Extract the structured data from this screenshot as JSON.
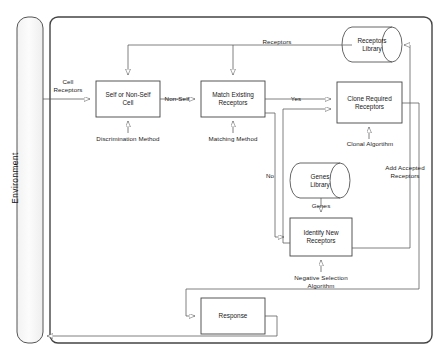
{
  "diagram": {
    "environment_label": "Environment",
    "colors": {
      "stroke": "#555555",
      "box_stroke": "#444444",
      "fill": "#ffffff",
      "env_fill": "#fbfbfb",
      "text": "#1a1a1a"
    },
    "boxes": [
      {
        "id": "self-or-nonself-cell",
        "label": "Self or Non-Self\nCell",
        "line1": "Self or Non-Self",
        "line2": "Cell"
      },
      {
        "id": "match-existing-receptors",
        "label": "Match Existing\nReceptors",
        "line1": "Match Existing",
        "line2": "Receptors"
      },
      {
        "id": "clone-required-receptors",
        "label": "Clone Required\nReceptors",
        "line1": "Clone Required",
        "line2": "Receptors"
      },
      {
        "id": "identify-new-receptors",
        "label": "Identify New\nReceptors",
        "line1": "Identify New",
        "line2": "Receptors"
      },
      {
        "id": "response",
        "label": "Response",
        "line1": "Response",
        "line2": ""
      }
    ],
    "cylinders": [
      {
        "id": "receptors-library",
        "line1": "Receptors",
        "line2": "Library"
      },
      {
        "id": "genes-library",
        "line1": "Genes",
        "line2": "Library"
      }
    ],
    "edge_labels": [
      {
        "id": "cell-receptors",
        "line1": "Cell",
        "line2": "Receptors"
      },
      {
        "id": "non-self",
        "line1": "Non-Self",
        "line2": ""
      },
      {
        "id": "yes",
        "line1": "Yes",
        "line2": ""
      },
      {
        "id": "no",
        "line1": "No",
        "line2": ""
      },
      {
        "id": "receptors",
        "line1": "Receptors",
        "line2": ""
      },
      {
        "id": "genes",
        "line1": "Genes",
        "line2": ""
      },
      {
        "id": "discrimination-method",
        "line1": "Discrimination Method",
        "line2": ""
      },
      {
        "id": "matching-method",
        "line1": "Matching Method",
        "line2": ""
      },
      {
        "id": "clonal-algorithm",
        "line1": "Clonal Algortihm",
        "line2": ""
      },
      {
        "id": "negative-selection-algorithm",
        "line1": "Negative Selection",
        "line2": "Algorithm"
      },
      {
        "id": "add-accepted-receptors",
        "line1": "Add Accepted",
        "line2": "Receptors"
      }
    ]
  }
}
